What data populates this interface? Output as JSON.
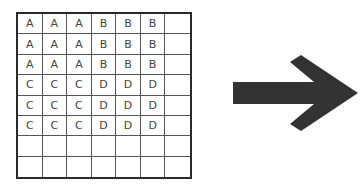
{
  "grid": {
    "columns": 7,
    "rows": 8,
    "cells": [
      [
        "A",
        "A",
        "A",
        "B",
        "B",
        "B",
        ""
      ],
      [
        "A",
        "A",
        "A",
        "B",
        "B",
        "B",
        ""
      ],
      [
        "A",
        "A",
        "A",
        "B",
        "B",
        "B",
        ""
      ],
      [
        "C",
        "C",
        "C",
        "D",
        "D",
        "D",
        ""
      ],
      [
        "C",
        "C",
        "C",
        "D",
        "D",
        "D",
        ""
      ],
      [
        "C",
        "C",
        "C",
        "D",
        "D",
        "D",
        ""
      ],
      [
        "",
        "",
        "",
        "",
        "",
        "",
        ""
      ],
      [
        "",
        "",
        "",
        "",
        "",
        "",
        ""
      ]
    ]
  },
  "arrow": {
    "direction": "right",
    "color": "#333333"
  }
}
